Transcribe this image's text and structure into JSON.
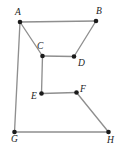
{
  "figure": {
    "background_color": "#ffffff",
    "edge_color": "#8f8f8f",
    "vertex_color": "#1b1b1b",
    "label_color": "#1b1b1b",
    "width": 125,
    "height": 151
  },
  "chart_data": {
    "type": "scatter",
    "title": "",
    "xlabel": "",
    "ylabel": "",
    "grid": false,
    "legend": "none",
    "xlim": [
      0,
      125
    ],
    "ylim": [
      0,
      151
    ],
    "vertices": [
      {
        "label": "A",
        "x": 20.0,
        "y": 22.0,
        "label_x": 15.0,
        "label_y": 8.0
      },
      {
        "label": "B",
        "x": 96.0,
        "y": 21.0,
        "label_x": 96.0,
        "label_y": 7.0
      },
      {
        "label": "C",
        "x": 42.5,
        "y": 56.0,
        "label_x": 37.0,
        "label_y": 42.0
      },
      {
        "label": "D",
        "x": 74.0,
        "y": 56.5,
        "label_x": 78.0,
        "label_y": 59.0
      },
      {
        "label": "E",
        "x": 41.5,
        "y": 93.5,
        "label_x": 31.0,
        "label_y": 92.0
      },
      {
        "label": "F",
        "x": 76.5,
        "y": 92.5,
        "label_x": 80.0,
        "label_y": 85.0
      },
      {
        "label": "G",
        "x": 14.5,
        "y": 132.0,
        "label_x": 11.0,
        "label_y": 135.0
      },
      {
        "label": "H",
        "x": 108.5,
        "y": 132.0,
        "label_x": 107.0,
        "label_y": 136.0
      }
    ],
    "edges": [
      {
        "from": "A",
        "to": "B"
      },
      {
        "from": "A",
        "to": "C"
      },
      {
        "from": "A",
        "to": "G"
      },
      {
        "from": "B",
        "to": "D"
      },
      {
        "from": "C",
        "to": "D"
      },
      {
        "from": "C",
        "to": "E"
      },
      {
        "from": "E",
        "to": "F"
      },
      {
        "from": "F",
        "to": "H"
      },
      {
        "from": "G",
        "to": "H"
      }
    ]
  }
}
